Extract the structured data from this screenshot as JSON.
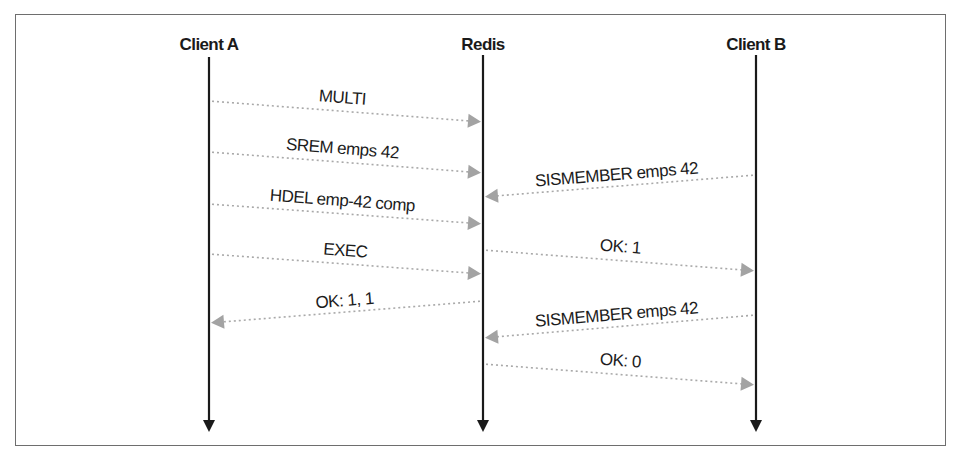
{
  "diagram": {
    "type": "sequence",
    "frame": {
      "x": 15,
      "y": 14,
      "width": 931,
      "height": 432,
      "border_color": "#6e6e6e"
    },
    "colors": {
      "lifeline": "#1a1a1a",
      "message_line": "#a9a9a9",
      "message_arrowhead": "#a3a3a3",
      "text": "#1c1c1c"
    },
    "actors": [
      {
        "id": "client_a",
        "label": "Client A",
        "x": 209,
        "label_y": 50,
        "line_top": 57,
        "line_bottom": 430
      },
      {
        "id": "redis",
        "label": "Redis",
        "x": 483,
        "label_y": 50,
        "line_top": 55,
        "line_bottom": 430
      },
      {
        "id": "client_b",
        "label": "Client B",
        "x": 756,
        "label_y": 50,
        "line_top": 55,
        "line_bottom": 430
      }
    ],
    "messages": [
      {
        "label": "MULTI",
        "from": "client_a",
        "to": "redis",
        "y_from": 101,
        "y_to": 122,
        "label_x": 342,
        "label_y": 103
      },
      {
        "label": "SREM emps 42",
        "from": "client_a",
        "to": "redis",
        "y_from": 152,
        "y_to": 173,
        "label_x": 342,
        "label_y": 154
      },
      {
        "label": "SISMEMBER emps 42",
        "from": "client_b",
        "to": "redis",
        "y_from": 175,
        "y_to": 197,
        "label_x": 617,
        "label_y": 180
      },
      {
        "label": "HDEL emp-42 comp",
        "from": "client_a",
        "to": "redis",
        "y_from": 204,
        "y_to": 224,
        "label_x": 342,
        "label_y": 206
      },
      {
        "label": "OK: 1",
        "from": "redis",
        "to": "client_b",
        "y_from": 250,
        "y_to": 271,
        "label_x": 620,
        "label_y": 252
      },
      {
        "label": "EXEC",
        "from": "client_a",
        "to": "redis",
        "y_from": 254,
        "y_to": 274,
        "label_x": 345,
        "label_y": 256
      },
      {
        "label": "OK: 1, 1",
        "from": "redis",
        "to": "client_a",
        "y_from": 301,
        "y_to": 323,
        "label_x": 345,
        "label_y": 306
      },
      {
        "label": "SISMEMBER emps 42",
        "from": "client_b",
        "to": "redis",
        "y_from": 315,
        "y_to": 338,
        "label_x": 617,
        "label_y": 320
      },
      {
        "label": "OK: 0",
        "from": "redis",
        "to": "client_b",
        "y_from": 364,
        "y_to": 385,
        "label_x": 620,
        "label_y": 366
      }
    ]
  }
}
